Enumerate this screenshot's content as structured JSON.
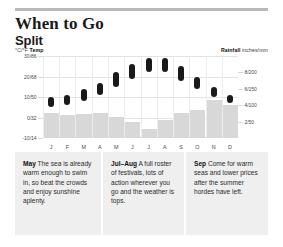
{
  "header": {
    "title": "When to Go",
    "subtitle": "Split",
    "legend_left_unit": "°C/°F",
    "legend_left_label": "Temp",
    "legend_right_label": "Rainfall",
    "legend_right_unit": "inches/mm"
  },
  "chart_data": {
    "type": "bar",
    "xlabel": "",
    "ylabel": "°C/°F Temp",
    "y2label": "Rainfall inches/mm",
    "grid": true,
    "legend_position": "top",
    "categories": [
      "J",
      "F",
      "M",
      "A",
      "M",
      "J",
      "J",
      "A",
      "S",
      "O",
      "N",
      "D"
    ],
    "month_labels": [
      "J",
      "F",
      "M",
      "A",
      "M",
      "J",
      "J",
      "A",
      "S",
      "O",
      "N",
      "D"
    ],
    "temp_axis": {
      "unit": "°C/°F",
      "ticks": [
        "30/86",
        "20/68",
        "10/50",
        "0/32",
        "-10/14"
      ],
      "tick_values_c": [
        30,
        20,
        10,
        0,
        -10
      ],
      "ylim": [
        -10,
        30
      ]
    },
    "rain_axis": {
      "unit": "inches/mm",
      "ticks": [
        "8/200",
        "6/150",
        "4/100",
        "2/50"
      ],
      "tick_values_in": [
        8,
        6,
        4,
        2
      ],
      "ylim": [
        0,
        10
      ]
    },
    "series": [
      {
        "name": "Temp low (°C)",
        "values": [
          5,
          6,
          8,
          11,
          15,
          19,
          22,
          22,
          18,
          14,
          10,
          7
        ]
      },
      {
        "name": "Temp high (°C)",
        "values": [
          10,
          11,
          14,
          17,
          22,
          26,
          29,
          29,
          25,
          20,
          15,
          11
        ]
      },
      {
        "name": "Rainfall (inches)",
        "values": [
          3.0,
          2.8,
          2.9,
          3.1,
          2.6,
          2.0,
          1.1,
          2.2,
          3.0,
          3.4,
          4.6,
          4.0
        ]
      }
    ]
  },
  "notes": [
    {
      "month": "May",
      "text": " The sea is already warm enough to swim in, so beat the crowds and enjoy sunshine aplenty."
    },
    {
      "month": "Jul–Aug",
      "text": " A full roster of festivals, lots of action wherever you go and the weather is tops."
    },
    {
      "month": "Sep",
      "text": " Come for warm seas and lower prices after the summer hordes have left."
    }
  ]
}
